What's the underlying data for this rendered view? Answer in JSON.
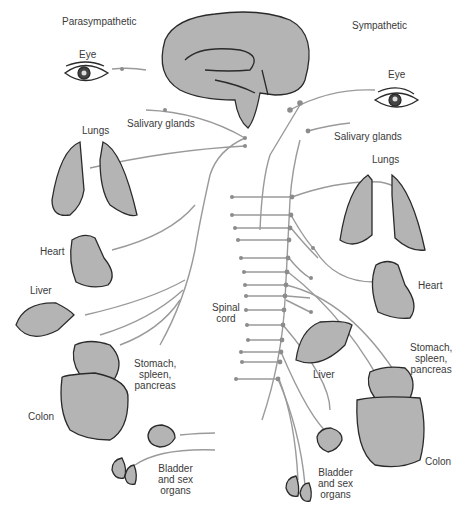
{
  "diagram": {
    "type": "autonomic-nervous-system",
    "sides": {
      "left": {
        "title": "Parasympathetic"
      },
      "right": {
        "title": "Sympathetic"
      }
    },
    "labels": {
      "left": {
        "eye": "Eye",
        "salivary": "Salivary glands",
        "lungs": "Lungs",
        "heart": "Heart",
        "liver": "Liver",
        "stomach": "Stomach,\nspleen,\npancreas",
        "colon": "Colon",
        "bladder": "Bladder\nand sex\norgans"
      },
      "center": {
        "spinal_cord": "Spinal\ncord"
      },
      "right": {
        "eye": "Eye",
        "salivary": "Salivary glands",
        "lungs": "Lungs",
        "heart": "Heart",
        "liver": "Liver",
        "stomach": "Stomach,\nspleen,\npancreas",
        "colon": "Colon",
        "bladder": "Bladder\nand sex\norgans"
      }
    },
    "colors": {
      "organ_fill": "#b4b4b4",
      "organ_stroke": "#2a2a2a",
      "nerve": "#9a9a9a",
      "node": "#8c8c8c",
      "text": "#3a3a3a"
    }
  }
}
